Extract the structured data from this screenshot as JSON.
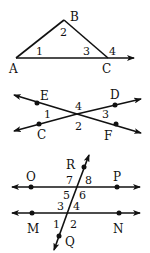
{
  "figure1": {
    "points": {
      "A": "A",
      "B": "B",
      "C": "C"
    },
    "angles": [
      "1",
      "2",
      "3",
      "4"
    ]
  },
  "figure2": {
    "points": {
      "E": "E",
      "D": "D",
      "C": "C",
      "F": "F"
    },
    "angles": [
      "1",
      "2",
      "3",
      "4"
    ]
  },
  "figure3": {
    "points": {
      "R": "R",
      "O": "O",
      "P": "P",
      "M": "M",
      "N": "N",
      "Q": "Q"
    },
    "angles": [
      "1",
      "2",
      "3",
      "4",
      "5",
      "6",
      "7",
      "8"
    ]
  }
}
